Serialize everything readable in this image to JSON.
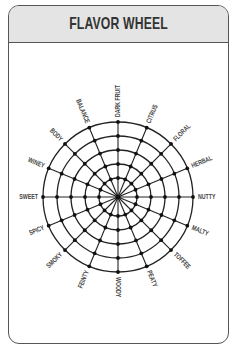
{
  "card": {
    "title": "FLAVOR WHEEL"
  },
  "wheel": {
    "center": [
      118,
      197
    ],
    "ring_radii": [
      19,
      33,
      47,
      61,
      75
    ],
    "spoke_count": 16,
    "labels": [
      "DARK FRUIT",
      "CITRUS",
      "FLORAL",
      "HERBAL",
      "NUTTY",
      "MALTY",
      "TOFFEE",
      "PEATY",
      "WOODY",
      "FEINTY",
      "SMOKY",
      "SPICY",
      "SWEET",
      "WINEY",
      "BODY",
      "BALANCE"
    ],
    "line_color": "#222222",
    "dot_color": "#111111"
  },
  "colors": {
    "header_bg": "#e4e4e4",
    "border": "#555555",
    "title": "#333333"
  }
}
